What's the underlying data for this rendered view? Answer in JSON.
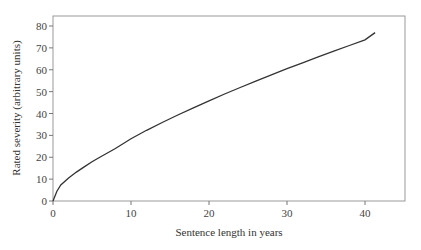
{
  "chart_data": {
    "type": "line",
    "title": "",
    "xlabel": "Sentence length in years",
    "ylabel": "Rated severity (arbitrary units)",
    "xlim": [
      0,
      45
    ],
    "ylim": [
      0,
      85
    ],
    "xticks": [
      0,
      10,
      20,
      30,
      40
    ],
    "yticks": [
      0,
      10,
      20,
      30,
      40,
      50,
      60,
      70,
      80
    ],
    "grid": false,
    "legend": null,
    "series": [
      {
        "name": "Rated severity",
        "x": [
          0,
          0.5,
          1,
          2,
          3,
          4,
          5,
          6,
          8,
          10,
          12,
          14,
          16,
          18,
          20,
          22,
          24,
          26,
          28,
          30,
          32,
          34,
          36,
          38,
          40,
          41.3
        ],
        "y": [
          0,
          4.5,
          7.3,
          10.5,
          13.2,
          15.6,
          17.9,
          20.0,
          24.0,
          28.5,
          32.3,
          35.9,
          39.3,
          42.6,
          45.8,
          48.9,
          51.9,
          54.8,
          57.7,
          60.5,
          63.2,
          65.9,
          68.5,
          71.1,
          73.7,
          77.0
        ]
      }
    ],
    "line_color": "#333333"
  }
}
